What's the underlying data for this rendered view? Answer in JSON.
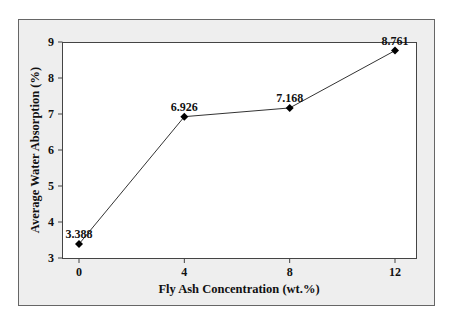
{
  "chart_data": {
    "type": "line",
    "title": "",
    "xlabel": "Fly Ash Concentration (wt.%)",
    "ylabel": "Average Water Absorption (%)",
    "x": [
      0,
      4,
      8,
      12
    ],
    "categories": [
      "0",
      "4",
      "8",
      "12"
    ],
    "series": [
      {
        "name": "Average Water Absorption",
        "values": [
          3.388,
          6.926,
          7.168,
          8.761
        ],
        "marker": "diamond",
        "color": "#000000"
      }
    ],
    "data_labels": [
      "3.388",
      "6.926",
      "7.168",
      "8.761"
    ],
    "xticks": [
      "0",
      "4",
      "8",
      "12"
    ],
    "yticks": [
      "3",
      "4",
      "5",
      "6",
      "7",
      "8",
      "9"
    ],
    "xlim": [
      -1.1,
      12.6
    ],
    "ylim": [
      2.95,
      9.05
    ],
    "grid": false,
    "legend": "none"
  },
  "colors": {
    "frame_background": "#eeeeee",
    "plot_background": "#ffffff",
    "line": "#333333"
  }
}
